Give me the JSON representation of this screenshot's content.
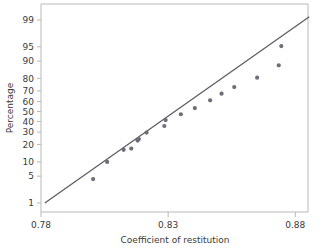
{
  "chart_data": {
    "type": "scatter",
    "title": "",
    "subtitle": "",
    "xlabel": "Coefficient of restitution",
    "ylabel": "Percentage",
    "plot_kind": "normal-probability-plot",
    "xlim": [
      0.78,
      0.885
    ],
    "x_ticks": [
      0.78,
      0.83,
      0.88
    ],
    "x_tick_labels": [
      "0.78",
      "0.83",
      "0.88"
    ],
    "y_ticks": [
      1,
      5,
      10,
      20,
      30,
      40,
      50,
      60,
      70,
      80,
      90,
      95,
      99
    ],
    "y_tick_labels": [
      "1",
      "5",
      "10",
      "20",
      "30",
      "40",
      "50",
      "60",
      "70",
      "80",
      "90",
      "95",
      "99"
    ],
    "y_scale": "normal-probability",
    "grid": false,
    "legend": null,
    "legend_position": "none",
    "point_color": "#6e6e78",
    "line_color": "#5d5d66",
    "frame_color": "#b9b9b9",
    "series": [
      {
        "name": "Coefficient of restitution",
        "marker": "circle",
        "points": [
          {
            "x": 0.8005,
            "y": 4.3
          },
          {
            "x": 0.806,
            "y": 10.0
          },
          {
            "x": 0.8125,
            "y": 16.5
          },
          {
            "x": 0.8155,
            "y": 17.3
          },
          {
            "x": 0.818,
            "y": 23.0
          },
          {
            "x": 0.8185,
            "y": 24.2
          },
          {
            "x": 0.8215,
            "y": 29.6
          },
          {
            "x": 0.8285,
            "y": 35.6
          },
          {
            "x": 0.829,
            "y": 41.4
          },
          {
            "x": 0.835,
            "y": 47.2
          },
          {
            "x": 0.8405,
            "y": 53.5
          },
          {
            "x": 0.8465,
            "y": 61.2
          },
          {
            "x": 0.851,
            "y": 67.5
          },
          {
            "x": 0.856,
            "y": 73.3
          },
          {
            "x": 0.865,
            "y": 80.5
          },
          {
            "x": 0.8735,
            "y": 88.0
          },
          {
            "x": 0.8745,
            "y": 95.2
          }
        ]
      }
    ],
    "fit_line": {
      "name": "reference line",
      "from": {
        "x": 0.7815,
        "y": 1.0
      },
      "to": {
        "x": 0.8855,
        "y": 99.2
      }
    }
  }
}
